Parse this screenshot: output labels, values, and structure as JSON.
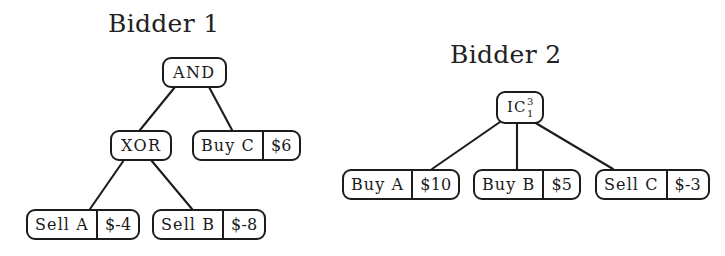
{
  "figure": {
    "background_color": "#ffffff",
    "stroke_color": "#1c1c1c",
    "text_color": "#1a1a1a"
  },
  "titles": {
    "bidder1": "Bidder 1",
    "bidder2": "Bidder 2"
  },
  "tree1": {
    "root": {
      "label": "AND"
    },
    "xor": {
      "label": "XOR"
    },
    "buy_c": {
      "label": "Buy C",
      "price": "$6"
    },
    "sell_a": {
      "label": "Sell A",
      "price": "$-4"
    },
    "sell_b": {
      "label": "Sell B",
      "price": "$-8"
    }
  },
  "tree2": {
    "root": {
      "label": "IC",
      "superscript": "3",
      "subscript": "1"
    },
    "buy_a": {
      "label": "Buy A",
      "price": "$10"
    },
    "buy_b": {
      "label": "Buy B",
      "price": "$5"
    },
    "sell_c": {
      "label": "Sell C",
      "price": "$-3"
    }
  }
}
